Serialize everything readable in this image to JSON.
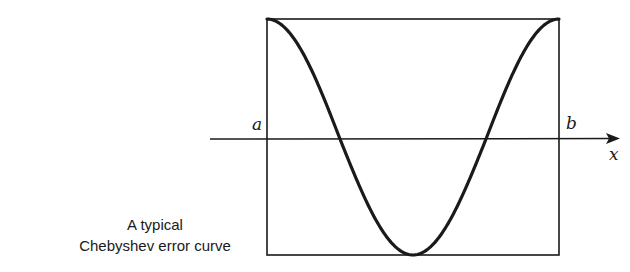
{
  "figure": {
    "caption_line1": "A typical",
    "caption_line2": "Chebyshev error curve",
    "label_a": "a",
    "label_b": "b",
    "label_x": "x",
    "stroke_color": "#1a1a1a"
  },
  "chart_data": {
    "type": "line",
    "title": "A typical Chebyshev error curve",
    "xlabel": "x",
    "ylabel": "",
    "x_tick_labels": [
      "a",
      "b"
    ],
    "xlim": [
      0,
      1
    ],
    "ylim": [
      -1,
      1
    ],
    "series": [
      {
        "name": "error curve",
        "x": [
          0,
          0.125,
          0.25,
          0.375,
          0.5,
          0.625,
          0.75,
          0.875,
          1
        ],
        "y": [
          1,
          0.707,
          0,
          -0.707,
          -1,
          -0.707,
          0,
          0.707,
          1
        ]
      }
    ],
    "extrema": [
      {
        "x": 0,
        "y": 1
      },
      {
        "x": 0.5,
        "y": -1
      },
      {
        "x": 1,
        "y": 1
      }
    ],
    "zero_crossings": [
      0.25,
      0.75
    ],
    "grid": false,
    "legend": "none"
  }
}
